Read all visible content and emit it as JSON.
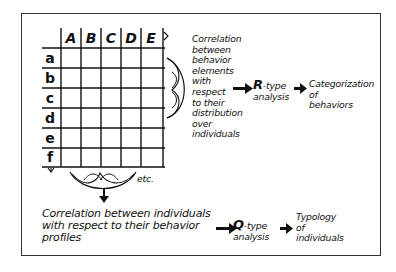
{
  "matrix": {
    "columns": [
      "A",
      "B",
      "C",
      "D",
      "E"
    ],
    "rows": [
      "a",
      "b",
      "c",
      "d",
      "e",
      "f"
    ],
    "continuation_label": "etc."
  },
  "r_branch": {
    "description_lines": [
      "Correlation",
      "between",
      "behavior",
      "elements",
      "with",
      "respect",
      "to their",
      "distribution",
      "over",
      "individuals"
    ],
    "analysis_letter": "R",
    "analysis_suffix": "-type",
    "analysis_word": "analysis",
    "result_lines": [
      "Categorization",
      "of",
      "behaviors"
    ]
  },
  "q_branch": {
    "description_lines": [
      "Correlation between individuals",
      "with respect to their behavior",
      "profiles"
    ],
    "analysis_letter": "Q",
    "analysis_suffix": "-type",
    "analysis_word": "analysis",
    "result_lines": [
      "Typology",
      "of",
      "individuals"
    ]
  },
  "colors": {
    "ink": "#111111",
    "frame": "#333333",
    "background": "#ffffff"
  }
}
